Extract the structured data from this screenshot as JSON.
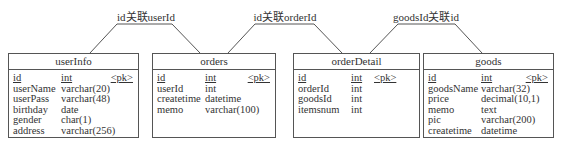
{
  "relations": [
    {
      "label": "id关联userId",
      "from": "userInfo",
      "to": "orders"
    },
    {
      "label": "id关联orderId",
      "from": "orders",
      "to": "orderDetail"
    },
    {
      "label": "goodsId关联id",
      "from": "orderDetail",
      "to": "goods"
    }
  ],
  "entities": [
    {
      "name": "userInfo",
      "pk_marker": "<pk>",
      "fields": [
        {
          "name": "id",
          "type": "int"
        },
        {
          "name": "userName",
          "type": "varchar(20)"
        },
        {
          "name": "userPass",
          "type": "varchar(48)"
        },
        {
          "name": "birthday",
          "type": "date"
        },
        {
          "name": "gender",
          "type": "char(1)"
        },
        {
          "name": "address",
          "type": "varchar(256)"
        }
      ]
    },
    {
      "name": "orders",
      "pk_marker": "<pk>",
      "fields": [
        {
          "name": "id",
          "type": "int"
        },
        {
          "name": "userId",
          "type": "int"
        },
        {
          "name": "createtime",
          "type": "datetime"
        },
        {
          "name": "memo",
          "type": "varchar(100)"
        }
      ]
    },
    {
      "name": "orderDetail",
      "pk_marker": "<pk>",
      "fields": [
        {
          "name": "id",
          "type": "int"
        },
        {
          "name": "orderId",
          "type": "int"
        },
        {
          "name": "goodsId",
          "type": "int"
        },
        {
          "name": "itemsnum",
          "type": "int"
        }
      ]
    },
    {
      "name": "goods",
      "pk_marker": "<pk>",
      "fields": [
        {
          "name": "id",
          "type": "int"
        },
        {
          "name": "goodsName",
          "type": "varchar(32)"
        },
        {
          "name": "price",
          "type": "decimal(10,1)"
        },
        {
          "name": "memo",
          "type": "text"
        },
        {
          "name": "pic",
          "type": "varchar(200)"
        },
        {
          "name": "createtime",
          "type": "datetime"
        }
      ]
    }
  ]
}
